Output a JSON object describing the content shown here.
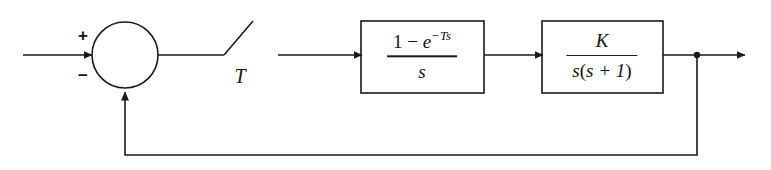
{
  "diagram": {
    "line_color": "#1a1a1a",
    "background": "#ffffff",
    "summing_junction": {
      "name": "summing-junction",
      "plus_sign": "+",
      "minus_sign": "−"
    },
    "sampler": {
      "name": "sampler-switch",
      "period_label": "T"
    },
    "blocks": [
      {
        "name": "zero-order-hold-block",
        "numerator_prefix": "1 − ",
        "numerator_base": "e",
        "numerator_exponent": "−Ts",
        "denominator": "s"
      },
      {
        "name": "plant-block",
        "numerator": "K",
        "denominator_prefix": "s",
        "denominator_group_open": "(",
        "denominator_group": "s + 1",
        "denominator_group_close": ")"
      }
    ],
    "signals": {
      "input_arrow": "input-signal-arrow",
      "output_arrow": "output-signal-arrow",
      "feedback_path": "feedback-path",
      "output_tap": "output-tap-junction"
    }
  }
}
